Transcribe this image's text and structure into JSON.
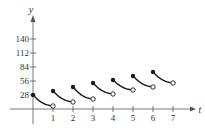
{
  "chart_data": {
    "type": "line",
    "title": "",
    "xlabel": "t",
    "ylabel": "y",
    "xlim": [
      0,
      7.6
    ],
    "ylim": [
      0,
      160
    ],
    "x_ticks": [
      1,
      2,
      3,
      4,
      5,
      6,
      7
    ],
    "y_ticks": [
      28,
      56,
      84,
      112,
      140
    ],
    "grid": false,
    "legend": null,
    "series": [
      {
        "name": "segment-0",
        "points": [
          [
            0,
            28
          ],
          [
            1,
            6
          ]
        ],
        "start": "closed",
        "end": "open"
      },
      {
        "name": "segment-1",
        "points": [
          [
            1,
            36
          ],
          [
            2,
            14
          ]
        ],
        "start": "closed",
        "end": "open"
      },
      {
        "name": "segment-2",
        "points": [
          [
            2,
            44
          ],
          [
            3,
            20
          ]
        ],
        "start": "closed",
        "end": "open"
      },
      {
        "name": "segment-3",
        "points": [
          [
            3,
            52
          ],
          [
            4,
            30
          ]
        ],
        "start": "closed",
        "end": "open"
      },
      {
        "name": "segment-4",
        "points": [
          [
            4,
            58
          ],
          [
            5,
            38
          ]
        ],
        "start": "closed",
        "end": "open"
      },
      {
        "name": "segment-5",
        "points": [
          [
            5,
            66
          ],
          [
            6,
            44
          ]
        ],
        "start": "closed",
        "end": "open"
      },
      {
        "name": "segment-6",
        "points": [
          [
            6,
            74
          ],
          [
            7,
            52
          ]
        ],
        "start": "closed",
        "end": "open"
      }
    ]
  },
  "colors": {
    "axis": "#555555",
    "curve": "#1a1a1a",
    "open_fill": "#ffffff"
  }
}
